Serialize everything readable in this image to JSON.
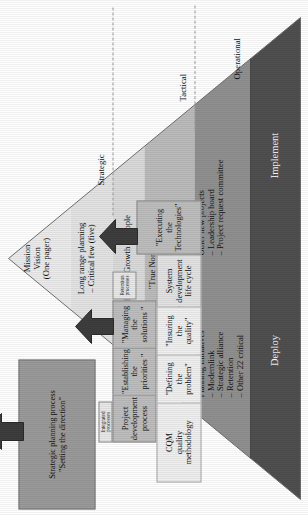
{
  "diagram": {
    "orientation": "rotated-90-ccw"
  },
  "tiers": [
    {
      "name": "strategic",
      "label": "Strategic"
    },
    {
      "name": "tactical",
      "label": "Tactical"
    },
    {
      "name": "operational",
      "label": "Operational"
    }
  ],
  "pyramid": {
    "bands": [
      {
        "name": "mission-vision",
        "color": "#eaeaea",
        "lines": "Mission\nVision\n(One pager)"
      },
      {
        "name": "long-range-planning",
        "color": "#e0e0e0",
        "lines": "Long range planning\n– Critical few (five)"
      },
      {
        "name": "profit-growth-people",
        "color": "#d6d6d6",
        "lines": "Profit – Growth – People"
      },
      {
        "name": "true-north",
        "color": "#b9b9b9",
        "lines": "\"True North\" - 95.5\nFix motorcycle\nExpand site built dwelling\nMaximize manufactured home"
      },
      {
        "name": "planning-initiatives",
        "color": "#8f8f8f",
        "lines_left": "Planning Initiatives\n– Modernlink\n– Strategic alliance\n– Retention\n– Other 22 critical",
        "lines_right": "Other new projects\n– Leadership board\n– Project request committee"
      },
      {
        "name": "deploy-implement",
        "color": "#4e4e4e",
        "deploy_label": "Deploy",
        "implement_label": "Implement"
      }
    ]
  },
  "processes": [
    {
      "name": "strategic-planning-process",
      "title": "Strategic planning process\n\"Setting the direction\""
    },
    {
      "name": "project-development-process",
      "title": "Project\ndevelopment\nprocess",
      "tag": "Integrated processes"
    },
    {
      "name": "cqm-quality-methodology",
      "title": "CQM\nquality\nmethodology"
    },
    {
      "name": "establishing-the-priorities",
      "title": "\"Establishing\nthe\npriorities \""
    },
    {
      "name": "defining-the-problem",
      "title": "\"Defining\nthe\nproblem\""
    },
    {
      "name": "managing-the-solutions",
      "title": "\"Managing\nthe\nsolutions \""
    },
    {
      "name": "insuring-the-quality",
      "title": "\"Insuring\nthe\nquality\""
    },
    {
      "name": "system-development-life-cycle",
      "title": "System\ndevelopment\nlife cycle",
      "tag": "Retention\nprocesses"
    },
    {
      "name": "executing-the-technologies",
      "title": "\"Executing\nthe\nTechnologies\""
    }
  ]
}
